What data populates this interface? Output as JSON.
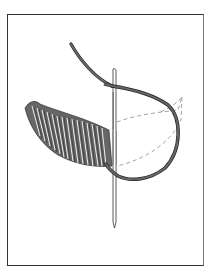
{
  "illustration": {
    "subject": "satin stitch embroidery with needle and thread",
    "colors": {
      "thread": "#666666",
      "thread_outline": "#222222",
      "stitch_highlight": "#ffffff",
      "guide_line": "#999999",
      "needle_fill": "#ffffff",
      "needle_outline": "#333333",
      "frame_border": "#333333",
      "background": "#ffffff"
    }
  }
}
